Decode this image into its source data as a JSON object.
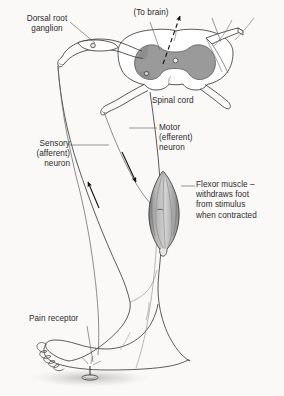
{
  "figure": {
    "background_color": "#faf9f7",
    "ink_color": "#2b2b2b",
    "gray_matter_color": "#9a9a9a",
    "muscle_fill_color": "#bdbdbd"
  },
  "labels": {
    "dorsal_root_ganglion": "Dorsal root\nganglion",
    "to_brain": "(To brain)",
    "spinal_cord": "Spinal cord",
    "sensory_neuron": "Sensory\n(afferent)\nneuron",
    "motor_neuron": "Motor\n(efferent)\nneuron",
    "flexor_muscle": "Flexor muscle –\nwithdraws foot\nfrom stimulus\nwhen contracted",
    "pain_receptor": "Pain receptor"
  },
  "structures": {
    "spinal_cord": "spinal-cord-cross-section",
    "gray_matter": "butterfly-gray-matter",
    "dorsal_root_ganglion": "dorsal-root-ganglion-swelling",
    "ganglion_cell_body": "sensory-cell-body",
    "ventral_root": "ventral-root",
    "dorsal_root": "dorsal-root",
    "flexor_muscle": "flexor-muscle-spindle",
    "leg": "leg-outline",
    "foot": "foot-outline",
    "tack": "tack-stimulus",
    "ground_stipple": "ground-stipple-shading"
  },
  "arrows": {
    "to_brain": "dashed-arrow-up",
    "sensory_direction": "arrow-up-toward-cord",
    "motor_direction": "arrow-down-toward-muscle"
  }
}
